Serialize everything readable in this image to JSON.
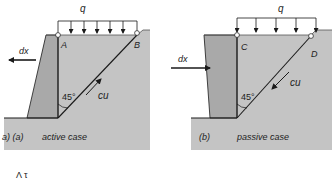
{
  "panels": [
    {
      "id": "a",
      "caption_prefix": "a) (a)",
      "caption": "active case",
      "load_label": "q",
      "point_top_left": "A",
      "point_top_right": "B",
      "displacement_label": "dx",
      "displacement_direction": "left",
      "angle_label": "45°",
      "shear_label": "cu",
      "shear_direction": "up-slope"
    },
    {
      "id": "b",
      "caption_prefix": "(b)",
      "caption": "passive case",
      "load_label": "q",
      "point_top_left": "C",
      "point_top_right": "D",
      "displacement_label": "dx",
      "displacement_direction": "right",
      "angle_label": "45°",
      "shear_label": "cu",
      "shear_direction": "down-slope"
    }
  ],
  "bottom_fragment": "Λ τ",
  "colors": {
    "soil": "#c4c4c4",
    "wall": "#a9a9a9",
    "line": "#1a1a1a",
    "background": "#ffffff"
  }
}
